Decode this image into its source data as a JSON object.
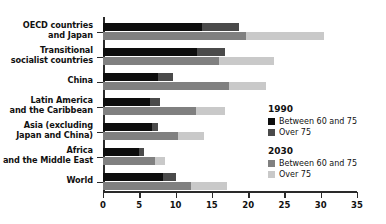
{
  "chart_data": {
    "type": "bar",
    "orientation": "horizontal",
    "stacked": true,
    "title": "",
    "subtitle": "",
    "xlabel": "",
    "ylabel": "",
    "xlim": [
      0,
      35
    ],
    "xticks": [
      0,
      5,
      10,
      15,
      20,
      25,
      30,
      35
    ],
    "xtick_labels": [
      "0",
      "5",
      "10",
      "15",
      "20",
      "25",
      "30",
      "35"
    ],
    "grid": false,
    "legend_position": "right",
    "categories": [
      "OECD countries\nand Japan",
      "Transitional\nsocialist countries",
      "China",
      "Latin America\nand the Caribbean",
      "Asia (excluding\nJapan and China)",
      "Africa\nand the Middle East",
      "World"
    ],
    "series": [
      {
        "name": "1990 Between 60 and 75",
        "group": "1990",
        "label": "Between 60 and 75",
        "color": "#0d0d0d",
        "values": [
          13.7,
          12.9,
          7.6,
          6.5,
          6.8,
          4.9,
          8.3
        ]
      },
      {
        "name": "1990 Over 75",
        "group": "1990",
        "label": "Over 75",
        "color": "#4a4a4a",
        "values": [
          5.0,
          3.9,
          2.1,
          1.4,
          0.8,
          0.7,
          1.8
        ]
      },
      {
        "name": "2030 Between 60 and 75",
        "group": "2030",
        "label": "Between 60 and 75",
        "color": "#808080",
        "values": [
          19.7,
          16.0,
          17.4,
          12.8,
          10.4,
          7.2,
          12.1
        ]
      },
      {
        "name": "2030 Over 75",
        "group": "2030",
        "label": "Over 75",
        "color": "#c9c9c9",
        "values": [
          10.8,
          7.5,
          5.1,
          4.0,
          3.5,
          1.3,
          5.0
        ]
      }
    ],
    "totals": {
      "1990": [
        18.7,
        16.8,
        9.7,
        7.9,
        7.6,
        5.6,
        10.1
      ],
      "2030": [
        30.5,
        23.5,
        22.5,
        16.8,
        13.9,
        8.5,
        17.1
      ]
    }
  },
  "legend": {
    "groups": [
      {
        "year": "1990",
        "entries": [
          {
            "label": "Between 60 and 75",
            "color": "#0d0d0d"
          },
          {
            "label": "Over 75",
            "color": "#4a4a4a"
          }
        ]
      },
      {
        "year": "2030",
        "entries": [
          {
            "label": "Between 60 and 75",
            "color": "#808080"
          },
          {
            "label": "Over 75",
            "color": "#c9c9c9"
          }
        ]
      }
    ]
  }
}
